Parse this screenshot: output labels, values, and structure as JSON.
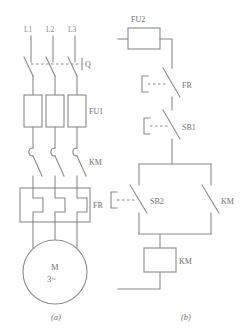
{
  "figure": {
    "sub_a": "(a)",
    "sub_b": "(b)"
  },
  "colors": {
    "line": "#8a8a8a",
    "text": "#6f6f6f",
    "background": "#ffffff"
  },
  "main_circuit": {
    "phase_labels": [
      "L1",
      "L2",
      "L3"
    ],
    "switch": {
      "label": "Q",
      "type": "three-pole-isolator"
    },
    "fuses": {
      "label": "FU1",
      "count": 3
    },
    "contactor_contacts": {
      "label": "KM",
      "count": 3
    },
    "overload_relay": {
      "label": "FR",
      "type": "thermal-heater"
    },
    "motor": {
      "symbol": "M",
      "phase": "3~"
    }
  },
  "control_circuit": {
    "fuse": {
      "label": "FU2"
    },
    "overload_nc": {
      "label": "FR"
    },
    "stop_button": {
      "label": "SB1"
    },
    "start_button": {
      "label": "SB2"
    },
    "holding_contact": {
      "label": "KM"
    },
    "coil": {
      "label": "KM"
    }
  }
}
